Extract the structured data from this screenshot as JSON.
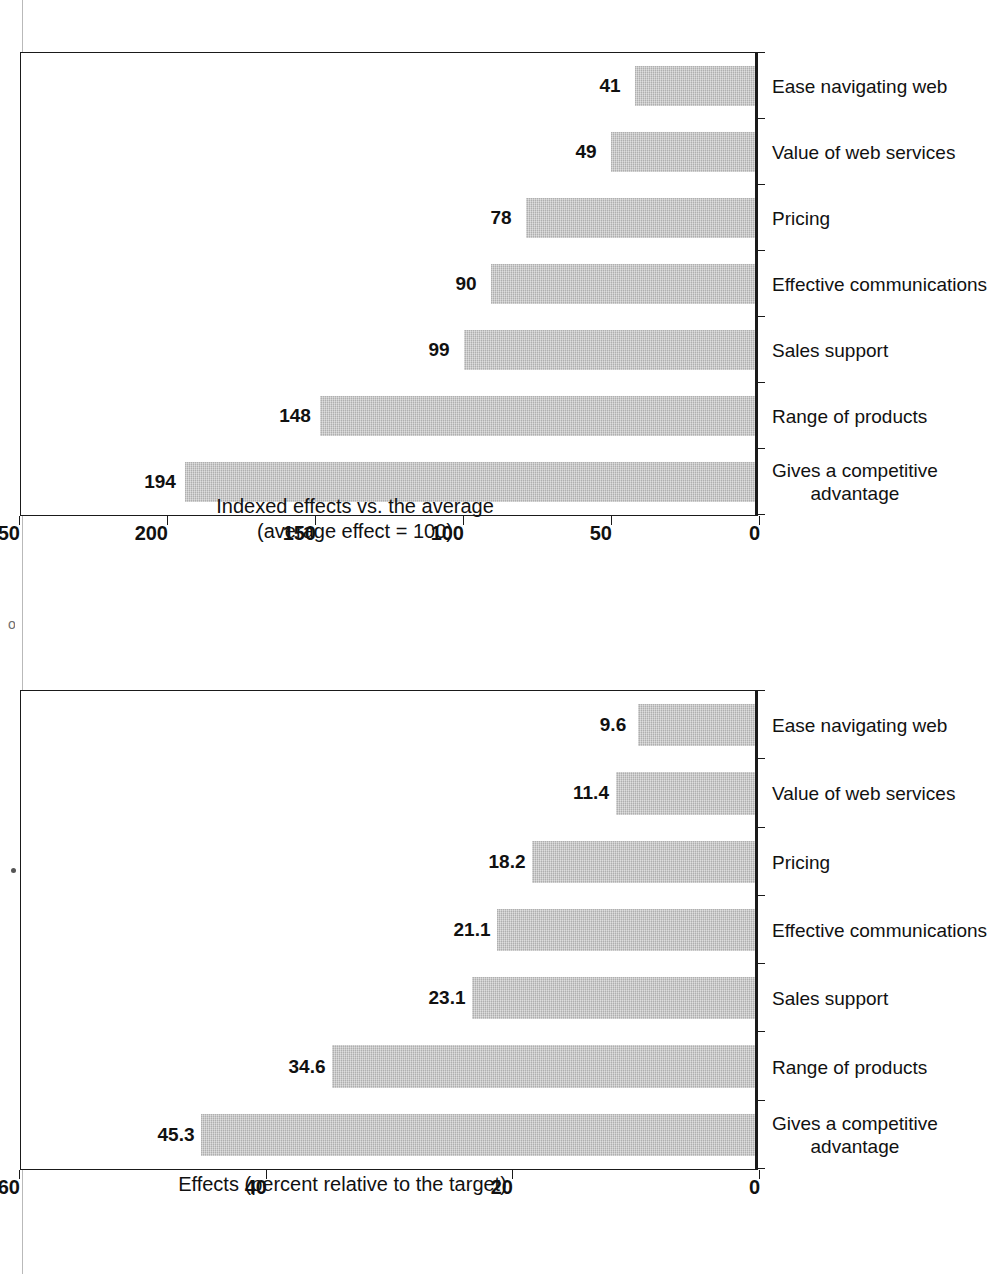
{
  "page": {
    "orientation_note": "rotated-90-ccw-scan",
    "background_color": "#ffffff",
    "bar_color": "#c3c3c3",
    "ink_color": "#111111"
  },
  "charts": [
    {
      "id": "relative-effects",
      "title": "Relative effects",
      "chart_data": {
        "type": "bar",
        "title": "Relative effects",
        "subtitle": "",
        "xlabel": "",
        "ylabel": "Indexed effects vs. the average\n(average effect = 100)",
        "ylim": [
          0,
          250
        ],
        "yticks": [
          "0",
          "50",
          "100",
          "150",
          "200",
          "250"
        ],
        "ytick_values": [
          0,
          50,
          100,
          150,
          200,
          250
        ],
        "grid": false,
        "legend": "none",
        "categories": [
          "Gives a competitive\nadvantage",
          "Range of products",
          "Sales support",
          "Effective communications",
          "Pricing",
          "Value of web services",
          "Ease navigating web"
        ],
        "values": [
          194,
          148,
          99,
          90,
          78,
          49,
          41
        ],
        "value_labels": [
          "194",
          "148",
          "99",
          "90",
          "78",
          "49",
          "41"
        ]
      }
    },
    {
      "id": "absolute-effects",
      "title": "Absolute effects",
      "chart_data": {
        "type": "bar",
        "title": "Absolute effects",
        "subtitle": "",
        "xlabel": "",
        "ylabel": "Effects (percent relative to the target)",
        "ylim": [
          0,
          60
        ],
        "yticks": [
          "0",
          "20",
          "40",
          "60"
        ],
        "ytick_values": [
          0,
          20,
          40,
          60
        ],
        "grid": false,
        "legend": "none",
        "categories": [
          "Gives a competitive\nadvantage",
          "Range of products",
          "Sales support",
          "Effective communications",
          "Pricing",
          "Value of web services",
          "Ease navigating web"
        ],
        "values": [
          45.3,
          34.6,
          23.1,
          21.1,
          18.2,
          11.4,
          9.6
        ],
        "value_labels": [
          "45.3",
          "34.6",
          "23.1",
          "21.1",
          "18.2",
          "11.4",
          "9.6"
        ]
      }
    }
  ]
}
